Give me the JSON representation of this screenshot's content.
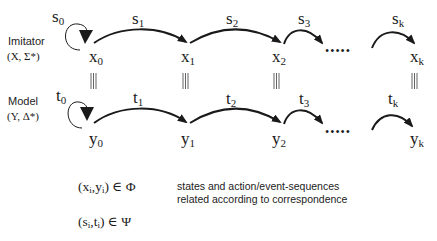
{
  "colors": {
    "stroke": "#1a1a1a",
    "text": "#1a1a1a",
    "background": "#ffffff"
  },
  "imitator": {
    "title": "Imitator",
    "signature": "(X, Σ*)",
    "states": [
      {
        "base": "x",
        "sub": "0"
      },
      {
        "base": "x",
        "sub": "1"
      },
      {
        "base": "x",
        "sub": "2"
      },
      {
        "base": "x",
        "sub": "k"
      }
    ],
    "actions": [
      {
        "base": "s",
        "sub": "0"
      },
      {
        "base": "s",
        "sub": "1"
      },
      {
        "base": "s",
        "sub": "2"
      },
      {
        "base": "s",
        "sub": "3"
      },
      {
        "base": "s",
        "sub": "k"
      }
    ]
  },
  "model": {
    "title": "Model",
    "signature": "(Y, Δ*)",
    "states": [
      {
        "base": "y",
        "sub": "0"
      },
      {
        "base": "y",
        "sub": "1"
      },
      {
        "base": "y",
        "sub": "2"
      },
      {
        "base": "y",
        "sub": "k"
      }
    ],
    "actions": [
      {
        "base": "t",
        "sub": "0"
      },
      {
        "base": "t",
        "sub": "1"
      },
      {
        "base": "t",
        "sub": "2"
      },
      {
        "base": "t",
        "sub": "3"
      },
      {
        "base": "t",
        "sub": "k"
      }
    ]
  },
  "correspondence_symbol": "|||",
  "ellipsis": "•••••",
  "legend": {
    "state_relation": {
      "pre": "(x",
      "i1": "i",
      "mid": ",y",
      "i2": "i",
      "post": ") ∈ Φ"
    },
    "action_relation": {
      "pre": "(s",
      "i1": "i",
      "mid": ",t",
      "i2": "i",
      "post": ") ∈ Ψ"
    },
    "caption_line1": "states and action/event-sequences",
    "caption_line2": "related according to correspondence"
  }
}
